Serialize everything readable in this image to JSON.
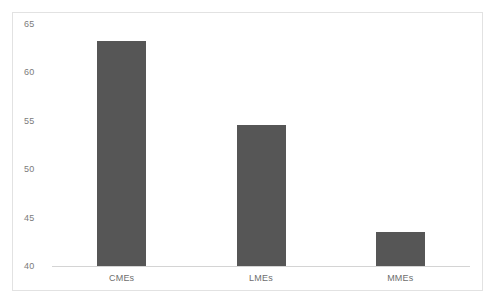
{
  "chart_data": {
    "type": "bar",
    "title": "",
    "subtitle": "",
    "xlabel": "",
    "ylabel": "",
    "categories": [
      "CMEs",
      "LMEs",
      "MMEs"
    ],
    "values": [
      63.2,
      54.6,
      43.5
    ],
    "series": [
      {
        "name": "",
        "values": [
          63.2,
          54.6,
          43.5
        ]
      }
    ],
    "ylim": [
      40,
      65
    ],
    "yticks": [
      40,
      45,
      50,
      55,
      60,
      65
    ],
    "ytick_labels": [
      "40",
      "45",
      "50",
      "55",
      "60",
      "65"
    ],
    "xtick_labels": [
      "CMEs",
      "LMEs",
      "MMEs"
    ],
    "grid": false,
    "legend": false,
    "legend_position": "none",
    "annotations": [],
    "bar_color": "#565656",
    "axis_color": "#d4d4d4",
    "tick_label_color": "#7b7b7b",
    "frame_color": "#e2e2e2",
    "background_color": "#ffffff"
  }
}
